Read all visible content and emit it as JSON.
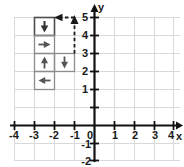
{
  "figure": {
    "title": "",
    "type": "coordinate-grid-arrow-path",
    "background_color": "#ffffff"
  },
  "axes": {
    "x_axis": {
      "label": "x",
      "min": -4,
      "max": 4,
      "tick_labels": [
        "-4",
        "-3",
        "-2",
        "-1",
        "0",
        "1",
        "2",
        "3",
        "4"
      ],
      "tick_values": [
        -4,
        -3,
        -2,
        -1,
        0,
        1,
        2,
        3,
        4
      ],
      "color": "#111111"
    },
    "y_axis": {
      "label": "y",
      "min": -2,
      "max": 5,
      "tick_labels": [
        "-2",
        "-1",
        "1",
        "2",
        "3",
        "4",
        "5"
      ],
      "tick_values": [
        -2,
        -1,
        1,
        2,
        3,
        4,
        5
      ],
      "color": "#111111"
    },
    "origin_label": "0",
    "grid": {
      "visible": true,
      "color": "#d9d9d9",
      "spacing": 1
    }
  },
  "cells": [
    {
      "id": "cell-down-top",
      "arrow": "down-arrow",
      "arrow_symbol": "↓",
      "x_range": [
        -3,
        -2
      ],
      "y_range": [
        4,
        5
      ],
      "border_color": "#4d4d4d",
      "fill": "none"
    },
    {
      "id": "cell-right",
      "arrow": "right-arrow",
      "arrow_symbol": "→",
      "x_range": [
        -3,
        -2
      ],
      "y_range": [
        3,
        4
      ],
      "border_color": "#8c8c8c",
      "fill": "none"
    },
    {
      "id": "cell-up",
      "arrow": "up-arrow",
      "arrow_symbol": "↑",
      "x_range": [
        -3,
        -2
      ],
      "y_range": [
        2,
        3
      ],
      "border_color": "#8c8c8c",
      "fill": "none"
    },
    {
      "id": "cell-down-mid",
      "arrow": "down-arrow",
      "arrow_symbol": "↓",
      "x_range": [
        -2,
        -1
      ],
      "y_range": [
        2,
        3
      ],
      "border_color": "#8c8c8c",
      "fill": "none"
    },
    {
      "id": "cell-left",
      "arrow": "left-arrow",
      "arrow_symbol": "←",
      "x_range": [
        -3,
        -2
      ],
      "y_range": [
        1,
        2
      ],
      "border_color": "#8c8c8c",
      "fill": "none"
    }
  ],
  "dashed_path": {
    "id": "dashed-return-path",
    "style": "dashed",
    "color": "#1a1a1a",
    "segments": [
      {
        "from": [
          -1,
          3
        ],
        "to": [
          -1,
          5
        ],
        "direction": "up",
        "arrowhead": "up-arrowhead"
      },
      {
        "from": [
          -1,
          5
        ],
        "to": [
          -2,
          5
        ],
        "direction": "left",
        "arrowhead": "left-arrowhead"
      }
    ]
  },
  "colors": {
    "axis": "#111111",
    "grid": "#d9d9d9",
    "cell_border_dark": "#4d4d4d",
    "cell_border_light": "#8c8c8c",
    "arrow": "#333333",
    "text": "#1a1a1a",
    "background": "#ffffff"
  }
}
